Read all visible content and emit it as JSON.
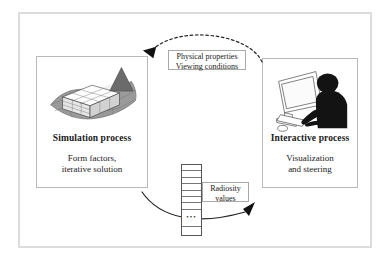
{
  "figure": {
    "panels": [
      {
        "id": "simulation",
        "title": "Simulation process",
        "subtitle": "Form factors,\niterative solution",
        "artwork": "radiosity-scene-illustration"
      },
      {
        "id": "interactive",
        "title": "Interactive process",
        "subtitle": "Visualization\nand steering",
        "artwork": "user-at-workstation-illustration"
      }
    ],
    "captions": {
      "physical": "Physical properties\nViewing conditions",
      "radiosity": "Radiosity\nvalues"
    },
    "vector": {
      "ellipsis": "•••",
      "cells_above": 7,
      "cells_below": 1
    },
    "arrows": [
      {
        "id": "top-arc",
        "style": "dashed",
        "direction": "right-to-left",
        "label": "Physical properties\nViewing conditions"
      },
      {
        "id": "bottom-arc",
        "style": "solid",
        "direction": "left-to-right",
        "label": "Radiosity\nvalues"
      }
    ],
    "colors": {
      "frame": "#dcdcdc",
      "panel_border": "#b9b9b9",
      "caption_border": "#a8a8a8",
      "ink": "#1a1a1a",
      "mesh_fill": "#9a9a9a",
      "mesh_fill_dark": "#7d7d7d",
      "light_cone": "#efefef",
      "silhouette": "#111111"
    }
  }
}
